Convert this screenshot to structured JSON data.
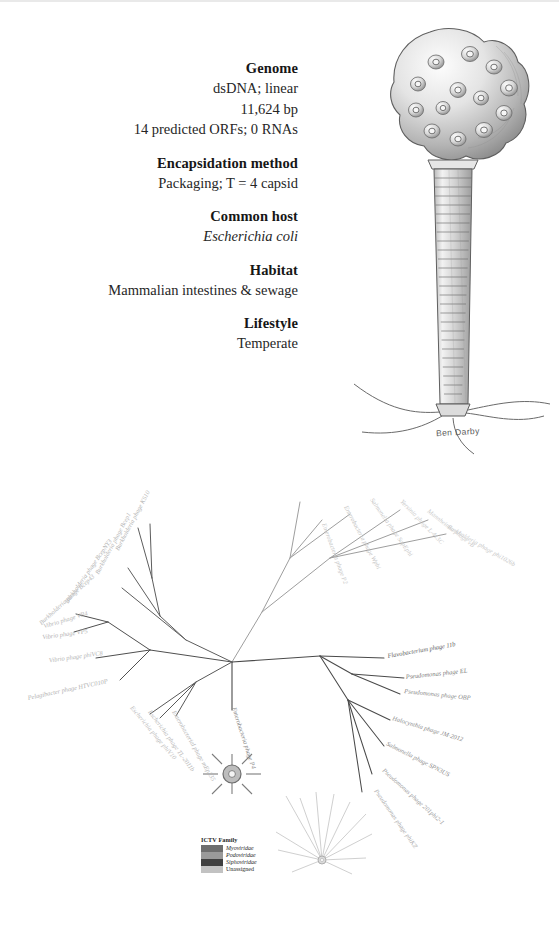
{
  "factsheet": {
    "sections": [
      {
        "heading": "Genome",
        "lines": [
          {
            "text": "dsDNA; linear",
            "italic": false
          },
          {
            "text": "11,624 bp",
            "italic": false
          },
          {
            "text": "14 predicted ORFs; 0 RNAs",
            "italic": false
          }
        ]
      },
      {
        "heading": "Encapsidation method",
        "lines": [
          {
            "text": "Packaging; T = 4 capsid",
            "italic": false
          }
        ]
      },
      {
        "heading": "Common host",
        "lines": [
          {
            "text": "Escherichia coli",
            "italic": true
          }
        ]
      },
      {
        "heading": "Habitat",
        "lines": [
          {
            "text": "Mammalian intestines & sewage",
            "italic": false
          }
        ]
      },
      {
        "heading": "Lifestyle",
        "lines": [
          {
            "text": "Temperate",
            "italic": false
          }
        ]
      }
    ]
  },
  "illustration": {
    "subject": "bacteriophage-p4",
    "signature": "Ben Darby",
    "ink_color": "#6b6b6b"
  },
  "tree": {
    "focus_taxon": "Enterobacteria phage P4",
    "legend": {
      "title": "ICTV Family",
      "entries": [
        {
          "label": "Myoviridae",
          "color": "#6e6e6e",
          "italic": true
        },
        {
          "label": "Podoviridae",
          "color": "#9a9a9a",
          "italic": true
        },
        {
          "label": "Siphoviridae",
          "color": "#404040",
          "italic": true
        },
        {
          "label": "Unassigned",
          "color": "#c2c2c2",
          "italic": false
        }
      ]
    },
    "labels": [
      {
        "text": "Burkholderia phage KS10",
        "x": 150,
        "y": 30,
        "rot": -62,
        "anchor": "end",
        "shade": "#b4b4b4"
      },
      {
        "text": "Burkholderia phage Bcep1",
        "x": 131,
        "y": 52,
        "rot": -62,
        "anchor": "end",
        "shade": "#b8b8b8"
      },
      {
        "text": "Burkholderia phage BcepNY3",
        "x": 112,
        "y": 79,
        "rot": -55,
        "anchor": "end",
        "shade": "#b0b0b0"
      },
      {
        "text": "Burkholderia phage Bcep43",
        "x": 95,
        "y": 115,
        "rot": -42,
        "anchor": "end",
        "shade": "#b6b6b6"
      },
      {
        "text": "Vibrio phage VP4",
        "x": 88,
        "y": 153,
        "rot": -17,
        "anchor": "end",
        "shade": "#b9b9b9"
      },
      {
        "text": "Vibrio phage VP5",
        "x": 88,
        "y": 171,
        "rot": -8,
        "anchor": "end",
        "shade": "#b2b2b2"
      },
      {
        "text": "Vibrio phage phiVC8",
        "x": 103,
        "y": 193,
        "rot": -8,
        "anchor": "end",
        "shade": "#b5b5b5"
      },
      {
        "text": "Pelagibacter phage HTVC010P",
        "x": 108,
        "y": 221,
        "rot": -12,
        "anchor": "end",
        "shade": "#b2b2b2"
      },
      {
        "text": "Escherichia phage phiV10",
        "x": 130,
        "y": 246,
        "rot": 50,
        "anchor": "start",
        "shade": "#bcbcbc"
      },
      {
        "text": "Escherichia phage TL-2011b",
        "x": 148,
        "y": 250,
        "rot": 54,
        "anchor": "start",
        "shade": "#b8b8b8"
      },
      {
        "text": "Enterobacterial phage mEp235",
        "x": 172,
        "y": 250,
        "rot": 60,
        "anchor": "start",
        "shade": "#b4b4b4"
      },
      {
        "text": "Enterobacteria phage P4",
        "x": 232,
        "y": 246,
        "rot": 72,
        "anchor": "start",
        "shade": "#8a8a8a"
      },
      {
        "text": "Flavobacterium phage 11b",
        "x": 388,
        "y": 196,
        "rot": -10,
        "anchor": "start",
        "shade": "#5e5e5e"
      },
      {
        "text": "Pseudomonas phage EL",
        "x": 406,
        "y": 217,
        "rot": -6,
        "anchor": "start",
        "shade": "#7c7c7c"
      },
      {
        "text": "Pseudomonas phage OBP",
        "x": 404,
        "y": 231,
        "rot": 6,
        "anchor": "start",
        "shade": "#8a8a8a"
      },
      {
        "text": "Halocynthia phage JM-2012",
        "x": 392,
        "y": 258,
        "rot": 17,
        "anchor": "start",
        "shade": "#8e8e8e"
      },
      {
        "text": "Salmonella phage SPN3US",
        "x": 386,
        "y": 283,
        "rot": 27,
        "anchor": "start",
        "shade": "#8c8c8c"
      },
      {
        "text": "Pseudomonas phage 201phi2-1",
        "x": 382,
        "y": 309,
        "rot": 42,
        "anchor": "start",
        "shade": "#9e9e9e"
      },
      {
        "text": "Pseudomonas phage phiKZ",
        "x": 374,
        "y": 329,
        "rot": 55,
        "anchor": "start",
        "shade": "#aaaaaa"
      },
      {
        "text": "Enterobacteria phage P2",
        "x": 322,
        "y": 62,
        "rot": 70,
        "anchor": "start",
        "shade": "#c6c6c6"
      },
      {
        "text": "Enterobacteria phage Wphi",
        "x": 344,
        "y": 45,
        "rot": 62,
        "anchor": "start",
        "shade": "#c4c4c4"
      },
      {
        "text": "Salmonella phage SopEphi",
        "x": 370,
        "y": 38,
        "rot": 55,
        "anchor": "start",
        "shade": "#c6c6c6"
      },
      {
        "text": "Yersinia phage L-413C",
        "x": 400,
        "y": 40,
        "rot": 46,
        "anchor": "start",
        "shade": "#c8c8c8"
      },
      {
        "text": "Mannheimia phage vB",
        "x": 427,
        "y": 50,
        "rot": 38,
        "anchor": "start",
        "shade": "#cacaca"
      },
      {
        "text": "Burkholderia phage phi1026b",
        "x": 447,
        "y": 66,
        "rot": 30,
        "anchor": "start",
        "shade": "#c9c9c9"
      }
    ]
  }
}
